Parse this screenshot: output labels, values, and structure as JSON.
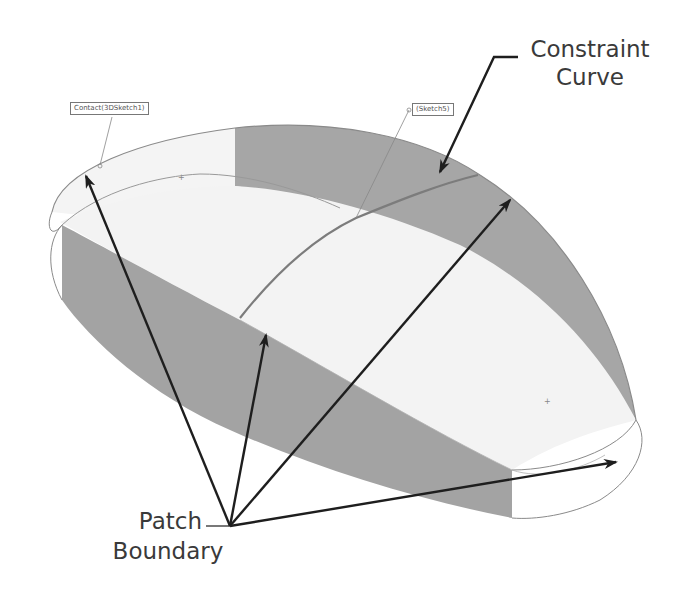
{
  "diagram": {
    "colors": {
      "background": "#ffffff",
      "surface_light": "#f2f2f2",
      "surface_dark": "#a3a3a3",
      "edge": "#8a8a8a",
      "arrow": "#1e1e1e",
      "label_text": "#3a3a3a"
    },
    "annotations": {
      "constraint_curve": {
        "line1": "Constraint",
        "line2": "Curve"
      },
      "patch_boundary": {
        "line1": "Patch",
        "line2": "Boundary"
      }
    },
    "tags": {
      "contact": "Contact(3DSketch1)",
      "sketch": "(Sketch5)"
    }
  }
}
